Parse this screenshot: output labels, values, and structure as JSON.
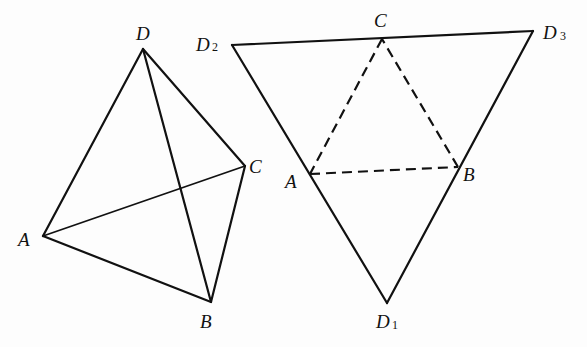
{
  "figure": {
    "left_tetrahedron": {
      "name": "tetrahedron ABCD",
      "vertices": {
        "A": {
          "label": "A",
          "x": 43,
          "y": 236
        },
        "B": {
          "label": "B",
          "x": 211,
          "y": 302
        },
        "C": {
          "label": "C",
          "x": 245,
          "y": 166
        },
        "D": {
          "label": "D",
          "x": 143,
          "y": 49
        }
      },
      "edges": [
        "DA",
        "DB",
        "DC",
        "AB",
        "BC",
        "AC"
      ]
    },
    "right_net": {
      "name": "unfolded net D1D2D3",
      "vertices": {
        "D1": {
          "label": "D",
          "subscript": "1",
          "x": 387,
          "y": 303
        },
        "D2": {
          "label": "D",
          "subscript": "2",
          "x": 232,
          "y": 45
        },
        "D3": {
          "label": "D",
          "subscript": "3",
          "x": 533,
          "y": 31
        },
        "A": {
          "label": "A",
          "x": 310,
          "y": 174
        },
        "B": {
          "label": "B",
          "x": 458,
          "y": 167
        },
        "C": {
          "label": "C",
          "x": 382,
          "y": 39
        }
      },
      "solid_edges": [
        "D2D3",
        "D2D1",
        "D3D1"
      ],
      "dashed_edges": [
        "AB",
        "BC",
        "CA"
      ]
    }
  }
}
